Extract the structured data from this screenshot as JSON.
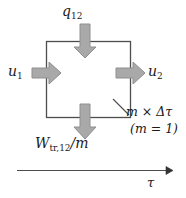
{
  "figure": {
    "type": "thermodynamic-control-mass-diagram",
    "colors": {
      "box_stroke": "#4d4d4d",
      "arrow_fill": "#a9a9a9",
      "arrow_stroke": "#8a8a8a",
      "axis": "#4d4d4d",
      "text": "#1a1a1a",
      "background": "#ffffff"
    },
    "box": {
      "x": 46,
      "y": 41,
      "width": 85,
      "height": 77
    },
    "labels": {
      "heat_in": "q",
      "heat_in_sub": "12",
      "energy_in": "u",
      "energy_in_sub": "1",
      "energy_out": "u",
      "energy_out_sub": "2",
      "work_out": "W",
      "work_out_sub": "tr,12",
      "work_out_div": "/m",
      "mass_time": "m × Δτ",
      "mass_value": "(m = 1)",
      "time_axis": "τ"
    },
    "arrows": [
      {
        "name": "heat-in-arrow",
        "direction": "down",
        "position": "top"
      },
      {
        "name": "energy-in-arrow",
        "direction": "right",
        "position": "left"
      },
      {
        "name": "energy-out-arrow",
        "direction": "right",
        "position": "right"
      },
      {
        "name": "work-out-arrow",
        "direction": "down",
        "position": "bottom"
      }
    ]
  }
}
